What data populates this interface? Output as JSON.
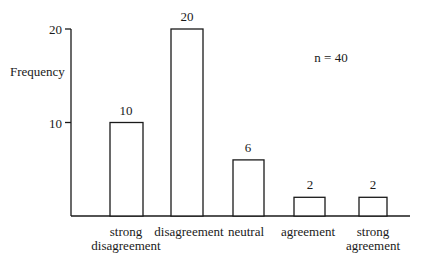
{
  "chart_data": {
    "type": "bar",
    "title": "",
    "xlabel": "",
    "ylabel": "Frequency",
    "categories": [
      "strong disagreement",
      "disagreement",
      "neutral",
      "agreement",
      "strong agreement"
    ],
    "category_lines": [
      [
        "strong",
        "disagreement"
      ],
      [
        "disagreement"
      ],
      [
        "neutral"
      ],
      [
        "agreement"
      ],
      [
        "strong",
        "agreement"
      ]
    ],
    "values": [
      10,
      20,
      6,
      2,
      2
    ],
    "data_labels": [
      "10",
      "20",
      "6",
      "2",
      "2"
    ],
    "yticks": [
      10,
      20
    ],
    "ytick_labels": [
      "10",
      "20"
    ],
    "ylim": [
      0,
      20
    ],
    "grid": false,
    "legend": null,
    "annotations": [
      "n = 40"
    ]
  },
  "annotation": {
    "sample_size": "n = 40"
  },
  "axis": {
    "ylabel": "Frequency"
  }
}
